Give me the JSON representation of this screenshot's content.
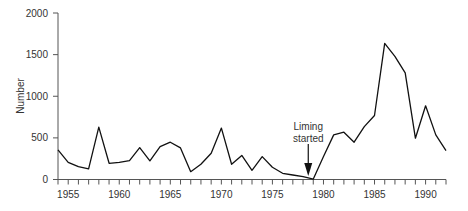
{
  "chart_data": {
    "type": "line",
    "title": "",
    "xlabel": "",
    "ylabel": "Number",
    "xlim": [
      1954,
      1992
    ],
    "ylim": [
      0,
      2000
    ],
    "grid": false,
    "legend": null,
    "x_ticks": [
      1955,
      1960,
      1965,
      1970,
      1975,
      1980,
      1985,
      1990
    ],
    "x_minor_tick_step": 1,
    "y_ticks": [
      0,
      500,
      1000,
      1500,
      2000
    ],
    "series": [
      {
        "name": "Number",
        "color": "#111111",
        "x": [
          1954,
          1955,
          1956,
          1957,
          1958,
          1959,
          1960,
          1961,
          1962,
          1963,
          1964,
          1965,
          1966,
          1967,
          1968,
          1969,
          1970,
          1971,
          1972,
          1973,
          1974,
          1975,
          1976,
          1977,
          1978,
          1979,
          1980,
          1981,
          1982,
          1983,
          1984,
          1985,
          1986,
          1987,
          1988,
          1989,
          1990,
          1991,
          1992
        ],
        "values": [
          355,
          207,
          154,
          127,
          629,
          195,
          207,
          227,
          383,
          223,
          395,
          448,
          380,
          94,
          183,
          315,
          617,
          183,
          290,
          110,
          275,
          147,
          75,
          54,
          34,
          5,
          275,
          536,
          568,
          448,
          636,
          769,
          1635,
          1480,
          1280,
          496,
          885,
          536,
          347
        ]
      }
    ],
    "annotations": [
      {
        "text_lines": [
          "Liming",
          "started"
        ],
        "x": 1979,
        "arrow": "down"
      }
    ]
  }
}
